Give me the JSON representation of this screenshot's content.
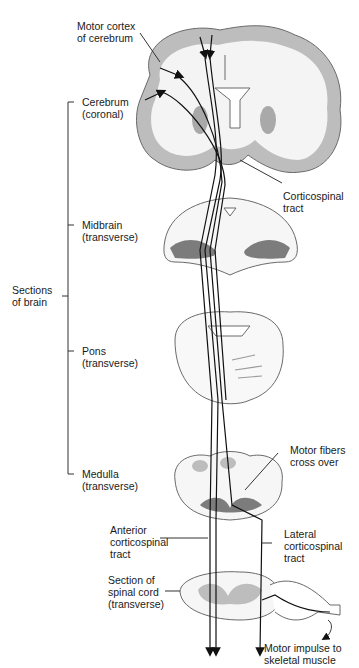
{
  "colors": {
    "background": "#ffffff",
    "outline": "#6a6a6a",
    "gray_matter": "#a9a9a9",
    "dark_gray": "#7c7c7c",
    "fiber": "#111111",
    "text": "#1a1a1a"
  },
  "labels": {
    "motor_cortex": "Motor cortex\nof cerebrum",
    "cerebrum": "Cerebrum\n(coronal)",
    "corticospinal_tract": "Corticospinal\ntract",
    "midbrain": "Midbrain\n(transverse)",
    "sections_of_brain": "Sections\nof brain",
    "pons": "Pons\n(transverse)",
    "motor_fibers_cross_over": "Motor fibers\ncross over",
    "medulla": "Medulla\n(transverse)",
    "anterior_corticospinal_tract": "Anterior\ncorticospinal\ntract",
    "lateral_corticospinal_tract": "Lateral\ncorticospinal\ntract",
    "spinal_cord_section": "Section of\nspinal cord\n(transverse)",
    "motor_impulse": "Motor impulse to\nskeletal muscle"
  }
}
